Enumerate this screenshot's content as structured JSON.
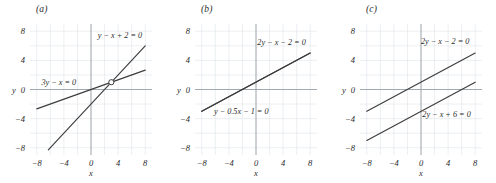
{
  "figure": {
    "background_color": "#ffffff",
    "grid_color": "#dfe4ea",
    "axis_color": "#9aa0a6",
    "line_color": "#3d3d3d",
    "text_color": "#2b2b2b",
    "marker_color": "#3d3d3d"
  },
  "panels": [
    {
      "caption": "(a)",
      "axis": {
        "xlabel": "x",
        "ylabel": "y",
        "xticks": [
          "-8",
          "-4",
          "0",
          "4",
          "8"
        ],
        "yticks": [
          "8",
          "4",
          "0",
          "-4",
          "-8"
        ],
        "xlim": [
          -9,
          9
        ],
        "ylim": [
          -9,
          9
        ],
        "grid": true
      },
      "labels": [
        {
          "text": "y - x + 2 = 0",
          "x": 1.0,
          "y": 7.1
        },
        {
          "text": "3y - x = 0",
          "x": -7.3,
          "y": 0.55
        }
      ],
      "markers": [
        {
          "type": "open-circle",
          "x": 3,
          "y": 1
        }
      ],
      "chart_data": {
        "type": "line",
        "title": "(a)",
        "xlabel": "x",
        "ylabel": "y",
        "xlim": [
          -9,
          9
        ],
        "ylim": [
          -9,
          9
        ],
        "grid": true,
        "legend": "inline-annotations",
        "series": [
          {
            "name": "y - x + 2 = 0",
            "slope": 1,
            "intercept": -2,
            "x": [
              -6.3,
              8
            ],
            "values": [
              -8.3,
              6
            ]
          },
          {
            "name": "3y - x = 0",
            "slope": 0.3333,
            "intercept": 0,
            "x": [
              -8,
              8
            ],
            "values": [
              -2.667,
              2.667
            ]
          }
        ],
        "intersections": [
          {
            "x": 3,
            "y": 1
          }
        ],
        "annotations": [
          "y - x + 2 = 0",
          "3y - x = 0"
        ]
      }
    },
    {
      "caption": "(b)",
      "axis": {
        "xlabel": "x",
        "ylabel": "y",
        "xticks": [
          "-8",
          "-4",
          "0",
          "4",
          "8"
        ],
        "yticks": [
          "8",
          "4",
          "0",
          "-4",
          "-8"
        ],
        "xlim": [
          -9,
          9
        ],
        "ylim": [
          -9,
          9
        ],
        "grid": true
      },
      "labels": [
        {
          "text": "2y - x - 2 = 0",
          "x": 0.2,
          "y": 6.1
        },
        {
          "text": "y - 0.5x - 1 = 0",
          "x": -6.2,
          "y": -3.3
        }
      ],
      "markers": [],
      "chart_data": {
        "type": "line",
        "title": "(b)",
        "xlabel": "x",
        "ylabel": "y",
        "xlim": [
          -9,
          9
        ],
        "ylim": [
          -9,
          9
        ],
        "grid": true,
        "legend": "inline-annotations",
        "series": [
          {
            "name": "2y - x - 2 = 0",
            "slope": 0.5,
            "intercept": 1,
            "x": [
              -8,
              8
            ],
            "values": [
              -3,
              5
            ]
          },
          {
            "name": "y - 0.5x - 1 = 0",
            "slope": 0.5,
            "intercept": 1,
            "x": [
              -8,
              8
            ],
            "values": [
              -3,
              5
            ]
          }
        ],
        "intersections": [],
        "annotations": [
          "2y - x - 2 = 0",
          "y - 0.5x - 1 = 0"
        ]
      }
    },
    {
      "caption": "(c)",
      "axis": {
        "xlabel": "x",
        "ylabel": "y",
        "xticks": [
          "-8",
          "-4",
          "0",
          "4",
          "8"
        ],
        "yticks": [
          "8",
          "4",
          "0",
          "-4",
          "-8"
        ],
        "xlim": [
          -9,
          9
        ],
        "ylim": [
          -9,
          9
        ],
        "grid": true
      },
      "labels": [
        {
          "text": "2y - x - 2 = 0",
          "x": 0.0,
          "y": 6.3
        },
        {
          "text": "2y - x + 6 = 0",
          "x": 0.2,
          "y": -3.8
        }
      ],
      "markers": [],
      "chart_data": {
        "type": "line",
        "title": "(c)",
        "xlabel": "x",
        "ylabel": "y",
        "xlim": [
          -9,
          9
        ],
        "ylim": [
          -9,
          9
        ],
        "grid": true,
        "legend": "inline-annotations",
        "series": [
          {
            "name": "2y - x - 2 = 0",
            "slope": 0.5,
            "intercept": 1,
            "x": [
              -8,
              8
            ],
            "values": [
              -3,
              5
            ]
          },
          {
            "name": "2y - x + 6 = 0",
            "slope": 0.5,
            "intercept": -3,
            "x": [
              -8,
              8
            ],
            "values": [
              -7,
              1
            ]
          }
        ],
        "intersections": [],
        "annotations": [
          "2y - x - 2 = 0",
          "2y - x + 6 = 0"
        ]
      }
    }
  ]
}
